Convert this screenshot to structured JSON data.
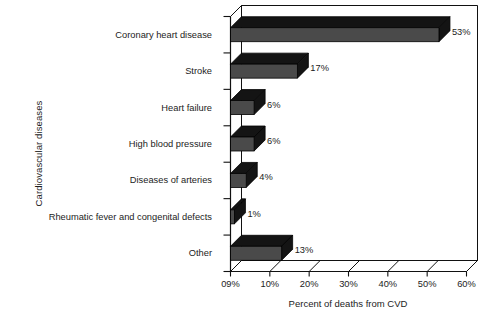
{
  "chart_data": {
    "type": "bar",
    "orientation": "horizontal",
    "style": "3d-bar",
    "title": "",
    "xlabel": "Percent of deaths from CVD",
    "ylabel": "Cardiovascular diseases",
    "categories": [
      "Coronary heart disease",
      "Stroke",
      "Heart failure",
      "High blood pressure",
      "Diseases of arteries",
      "Rheumatic fever and congenital defects",
      "Other"
    ],
    "values": [
      53,
      17,
      6,
      6,
      4,
      1,
      13
    ],
    "value_labels": [
      "53%",
      "17%",
      "6%",
      "6%",
      "4%",
      "1%",
      "13%"
    ],
    "xlim": [
      0,
      60
    ],
    "xticks": [
      0,
      10,
      20,
      30,
      40,
      50,
      60
    ],
    "xtick_labels": [
      "09%",
      "10%",
      "20%",
      "30%",
      "40%",
      "50%",
      "60%"
    ],
    "grid": true,
    "grid_axis": "x",
    "legend": null,
    "colors": {
      "bar_front": "#4a4a4a",
      "bar_top": "#141414",
      "bar_side": "#141414",
      "grid": "#9a9a9a",
      "axis": "#111111",
      "text": "#1c1c1c",
      "background": "#ffffff"
    }
  },
  "axis": {
    "y_title": "Cardiovascular diseases",
    "x_title": "Percent of deaths from CVD"
  }
}
